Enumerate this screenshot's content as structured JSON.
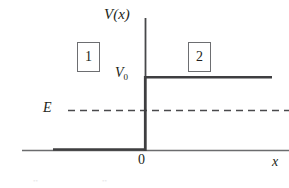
{
  "figure": {
    "axes": {
      "y_axis_label": "V(x)",
      "x_axis_label": "x",
      "origin_label": "0",
      "y_axis_x_px": 145,
      "y_axis_top_px": 18,
      "x_axis_y_px": 150,
      "x_axis_left_px": 22,
      "x_axis_right_px": 289
    },
    "levels": [
      {
        "name": "barrier-height",
        "label": "V",
        "subscript": "0",
        "value_label": "V_0",
        "y_px": 77,
        "x_start_px": 145,
        "x_end_px": 272,
        "style": "solid",
        "color": "#3f3f41"
      },
      {
        "name": "particle-energy",
        "label": "E",
        "value_label": "E",
        "y_px": 110,
        "x_start_px": 68,
        "x_end_px": 289,
        "style": "dashed",
        "color": "#4a4a4c"
      }
    ],
    "regions": [
      {
        "name": "region-1",
        "label": "1",
        "side": "left"
      },
      {
        "name": "region-2",
        "label": "2",
        "side": "right"
      }
    ],
    "potential_curve": {
      "name": "step-potential",
      "color": "#3f3f41",
      "segments": [
        {
          "name": "left-flat",
          "x1_px": 53,
          "y1_px": 150,
          "x2_px": 145,
          "y2_px": 150
        },
        {
          "name": "riser",
          "x1_px": 145,
          "y1_px": 150,
          "x2_px": 145,
          "y2_px": 77
        },
        {
          "name": "right-flat",
          "x1_px": 145,
          "y1_px": 77,
          "x2_px": 272,
          "y2_px": 77
        }
      ]
    },
    "colors": {
      "ink": "#231f20",
      "curve": "#3f3f41",
      "axis": "#58595b",
      "box_border": "#6d6e71",
      "background": "#ffffff"
    },
    "scan_artifacts": [
      {
        "name": "artifact-left",
        "text": "••"
      },
      {
        "name": "artifact-right",
        "text": "••"
      }
    ]
  }
}
